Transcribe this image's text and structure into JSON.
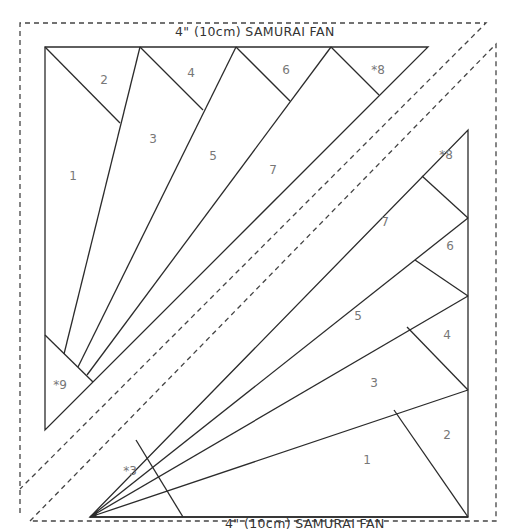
{
  "pattern": {
    "title_top": "4\" (10cm) SAMURAI FAN",
    "title_bottom": "4\" (10cm) SAMURAI FAN",
    "colors": {
      "line": "#2b2b2b",
      "dash": "#444444",
      "label": "#777777",
      "title": "#333333",
      "background": "#ffffff"
    }
  },
  "upper_left_block": {
    "labels": [
      {
        "text": "1",
        "x": 73,
        "y": 176
      },
      {
        "text": "2",
        "x": 104,
        "y": 80
      },
      {
        "text": "3",
        "x": 153,
        "y": 139
      },
      {
        "text": "4",
        "x": 191,
        "y": 73
      },
      {
        "text": "5",
        "x": 213,
        "y": 156
      },
      {
        "text": "6",
        "x": 286,
        "y": 70
      },
      {
        "text": "7",
        "x": 273,
        "y": 170
      },
      {
        "text": "*8",
        "x": 378,
        "y": 70
      },
      {
        "text": "*9",
        "x": 60,
        "y": 385
      }
    ]
  },
  "lower_right_block": {
    "labels": [
      {
        "text": "*8",
        "x": 446,
        "y": 155
      },
      {
        "text": "7",
        "x": 385,
        "y": 222
      },
      {
        "text": "6",
        "x": 450,
        "y": 246
      },
      {
        "text": "5",
        "x": 358,
        "y": 316
      },
      {
        "text": "4",
        "x": 447,
        "y": 335
      },
      {
        "text": "3",
        "x": 374,
        "y": 383
      },
      {
        "text": "2",
        "x": 447,
        "y": 435
      },
      {
        "text": "1",
        "x": 367,
        "y": 460
      },
      {
        "text": "*3",
        "x": 130,
        "y": 471
      }
    ]
  }
}
